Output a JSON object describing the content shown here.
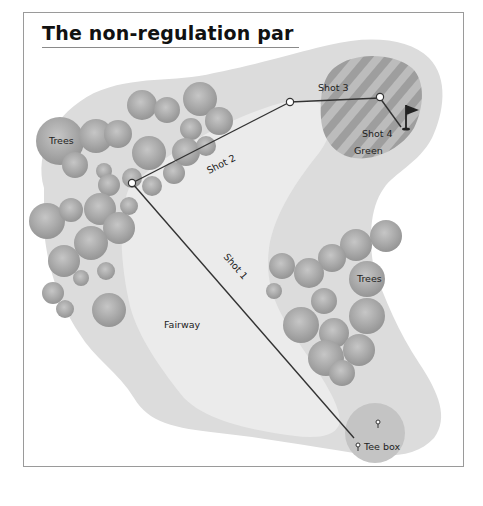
{
  "title": "The non-regulation par",
  "labels": {
    "trees_left": "Trees",
    "trees_right": "Trees",
    "fairway": "Fairway",
    "green": "Green",
    "tee_box": "Tee box",
    "shot1": "Shot 1",
    "shot2": "Shot 2",
    "shot3": "Shot 3",
    "shot4": "Shot 4"
  },
  "colors": {
    "rough": "#dcdcdc",
    "fairway": "#ebebeb",
    "tree": "#a8a8a8",
    "green_light": "#b8b8b8",
    "green_dark": "#9c9c9c",
    "tee": "#c4c4c4",
    "line": "#333333",
    "flag": "#222222"
  }
}
